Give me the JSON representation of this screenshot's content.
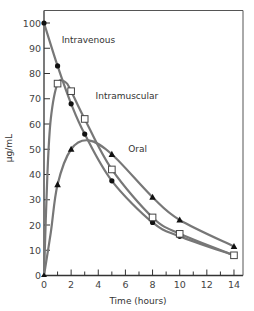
{
  "chart_data": {
    "type": "line",
    "title": "",
    "xlabel": "Time (hours)",
    "ylabel": "µg/mL",
    "xlim": [
      0,
      14
    ],
    "ylim": [
      0,
      100
    ],
    "xticks": [
      0,
      2,
      4,
      6,
      8,
      10,
      12,
      14
    ],
    "yticks": [
      0,
      10,
      20,
      30,
      40,
      50,
      60,
      70,
      80,
      90,
      100
    ],
    "grid": false,
    "legend": "inline annotations",
    "series": [
      {
        "name": "Intravenous",
        "marker": "filled-circle",
        "color": "#777777",
        "x": [
          0,
          1,
          2,
          3,
          5,
          8,
          10,
          14
        ],
        "values": [
          100,
          83,
          68,
          56,
          37.5,
          21,
          15.5,
          8
        ]
      },
      {
        "name": "Intramuscular",
        "marker": "open-square",
        "color": "#777777",
        "x": [
          0,
          1,
          2,
          3,
          5,
          8,
          10,
          14
        ],
        "values": [
          0,
          76,
          73,
          62,
          42,
          23,
          16.5,
          8
        ]
      },
      {
        "name": "Oral",
        "marker": "filled-triangle",
        "color": "#777777",
        "x": [
          0,
          1,
          2,
          5,
          8,
          10,
          14
        ],
        "values": [
          0,
          36,
          50,
          48,
          31,
          22,
          11.5
        ]
      }
    ],
    "annotations": [
      {
        "text": "Intravenous",
        "x": 1.3,
        "y": 92
      },
      {
        "text": "Intramuscular",
        "x": 3.8,
        "y": 70
      },
      {
        "text": "Oral",
        "x": 6.2,
        "y": 49
      }
    ]
  },
  "labels": {
    "xlabel": "Time (hours)",
    "ylabel": "µg/mL",
    "iv": "Intravenous",
    "im": "Intramuscular",
    "oral": "Oral"
  }
}
